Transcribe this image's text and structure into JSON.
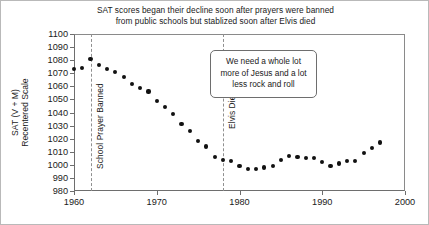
{
  "chart_data": {
    "type": "scatter",
    "title": "SAT scores began their decline soon after prayers were banned from public schools but stablized soon after Elvis died",
    "title_lines": [
      "SAT scores began their decline soon after prayers were banned",
      "from public schools but stablized soon after Elvis died"
    ],
    "xlabel": "",
    "ylabel": "SAT (V + M) Recentered Scale",
    "ylabel_lines": [
      "SAT (V + M)",
      "Recentered Scale"
    ],
    "xlim": [
      1960,
      2000
    ],
    "ylim": [
      980,
      1100
    ],
    "xticks": [
      1960,
      1970,
      1980,
      1990,
      2000
    ],
    "yticks": [
      980,
      990,
      1000,
      1010,
      1020,
      1030,
      1040,
      1050,
      1060,
      1070,
      1080,
      1090,
      1100
    ],
    "grid": false,
    "legend": "none",
    "marker": "filled-circle",
    "marker_color": "#111111",
    "x": [
      1960,
      1961,
      1962,
      1963,
      1964,
      1965,
      1966,
      1967,
      1968,
      1969,
      1970,
      1971,
      1972,
      1973,
      1974,
      1975,
      1976,
      1977,
      1978,
      1979,
      1980,
      1981,
      1982,
      1983,
      1984,
      1985,
      1986,
      1987,
      1988,
      1989,
      1990,
      1991,
      1992,
      1993,
      1994,
      1995,
      1996,
      1997
    ],
    "values": [
      1073,
      1074,
      1081,
      1076,
      1073,
      1071,
      1067,
      1062,
      1059,
      1056,
      1049,
      1044,
      1039,
      1031,
      1026,
      1018,
      1014,
      1006,
      1004,
      1003,
      999,
      997,
      997,
      998,
      999,
      1004,
      1007,
      1006,
      1005,
      1005,
      1002,
      999,
      1001,
      1003,
      1003,
      1009,
      1013,
      1017
    ],
    "annotations": [
      {
        "type": "vline",
        "name": "school-prayer-banned",
        "x": 1962,
        "label": "School Prayer Banned",
        "style": "dashed"
      },
      {
        "type": "vline",
        "name": "elvis-dies",
        "x": 1978,
        "label": "Elvis Dies",
        "style": "dashed"
      },
      {
        "type": "textbox",
        "name": "commentary-callout",
        "lines": [
          "We need a whole lot",
          "more of Jesus and a lot",
          "less rock and roll"
        ]
      }
    ]
  },
  "callout": {
    "line1": "We need a whole lot",
    "line2": "more of Jesus and a lot",
    "line3": "less rock and roll"
  },
  "vlines": {
    "prayer_label": "School Prayer Banned",
    "elvis_label": "Elvis Dies"
  }
}
